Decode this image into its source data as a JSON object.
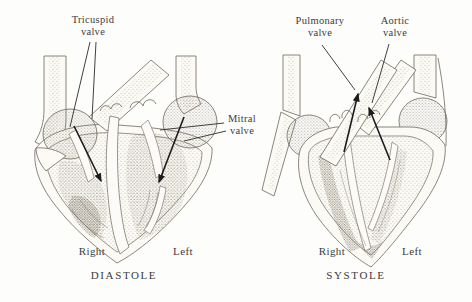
{
  "colors": {
    "background": "#fdfdfc",
    "ink_outline": "#6e675c",
    "stipple": "#82796a",
    "text": "#3c3c3c",
    "arrow": "#1c1c1c"
  },
  "diastole": {
    "caption": "DIASTOLE",
    "left_chamber_label": "Right",
    "right_chamber_label": "Left",
    "callouts": {
      "tricuspid": {
        "line1": "Tricuspid",
        "line2": "valve"
      },
      "mitral": {
        "line1": "Mitral",
        "line2": "valve"
      }
    }
  },
  "systole": {
    "caption": "SYSTOLE",
    "left_chamber_label": "Right",
    "right_chamber_label": "Left",
    "callouts": {
      "pulmonary": {
        "line1": "Pulmonary",
        "line2": "valve"
      },
      "aortic": {
        "line1": "Aortic",
        "line2": "valve"
      }
    }
  }
}
